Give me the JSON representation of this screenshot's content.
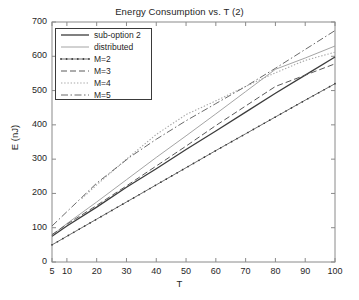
{
  "chart_data": {
    "type": "line",
    "title": "Energy Consumption vs. T (2)",
    "xlabel": "T",
    "ylabel": "E (nJ)",
    "xlim": [
      5,
      100
    ],
    "ylim": [
      0,
      700
    ],
    "xticks": [
      5,
      10,
      20,
      30,
      40,
      50,
      60,
      70,
      80,
      90,
      100
    ],
    "yticks": [
      0,
      100,
      200,
      300,
      400,
      500,
      600,
      700
    ],
    "grid": false,
    "legend_position": "upper left",
    "series": [
      {
        "name": "sub-option 2",
        "style": "solid",
        "color": "#3c3c3c",
        "x": [
          5,
          10,
          20,
          30,
          40,
          50,
          60,
          70,
          80,
          90,
          100
        ],
        "values": [
          75,
          105,
          160,
          218,
          272,
          328,
          382,
          437,
          492,
          545,
          598
        ]
      },
      {
        "name": "distributed",
        "style": "solid-thin",
        "color": "#9a9a9a",
        "x": [
          5,
          10,
          20,
          30,
          40,
          50,
          60,
          70,
          80,
          90,
          100
        ],
        "values": [
          78,
          112,
          175,
          240,
          305,
          368,
          432,
          497,
          562,
          595,
          630
        ]
      },
      {
        "name": "M=2",
        "style": "solid-dotmarks",
        "color": "#6e6e6e",
        "x": [
          5,
          10,
          20,
          30,
          40,
          50,
          60,
          70,
          80,
          90,
          100
        ],
        "values": [
          50,
          75,
          125,
          175,
          225,
          275,
          325,
          374,
          423,
          472,
          520
        ]
      },
      {
        "name": "M=3",
        "style": "dashed",
        "color": "#5a5a5a",
        "x": [
          5,
          10,
          20,
          30,
          40,
          50,
          60,
          70,
          80,
          90,
          100
        ],
        "values": [
          80,
          110,
          165,
          222,
          280,
          338,
          398,
          455,
          512,
          545,
          578
        ]
      },
      {
        "name": "M=4",
        "style": "dotted",
        "color": "#a8a8a8",
        "x": [
          15,
          20,
          30,
          40,
          50,
          60,
          70,
          80,
          90,
          100
        ],
        "values": [
          185,
          225,
          300,
          372,
          430,
          470,
          512,
          552,
          588,
          612
        ]
      },
      {
        "name": "M=5",
        "style": "dashdot",
        "color": "#6a6a6a",
        "x": [
          5,
          8,
          20,
          31,
          40,
          50,
          60,
          70,
          80,
          90,
          100
        ],
        "values": [
          105,
          130,
          230,
          305,
          358,
          412,
          462,
          512,
          565,
          620,
          675
        ]
      }
    ]
  },
  "axes": {
    "ytick_labels": [
      "700",
      "600",
      "500",
      "400",
      "300",
      "200",
      "100",
      "0"
    ],
    "xtick_labels": [
      "5",
      "10",
      "20",
      "30",
      "40",
      "50",
      "60",
      "70",
      "80",
      "90",
      "100"
    ]
  },
  "legend": {
    "entries": [
      {
        "label": "sub-option 2"
      },
      {
        "label": "distributed"
      },
      {
        "label": "M=2"
      },
      {
        "label": "M=3"
      },
      {
        "label": "M=4"
      },
      {
        "label": "M=5"
      }
    ]
  }
}
